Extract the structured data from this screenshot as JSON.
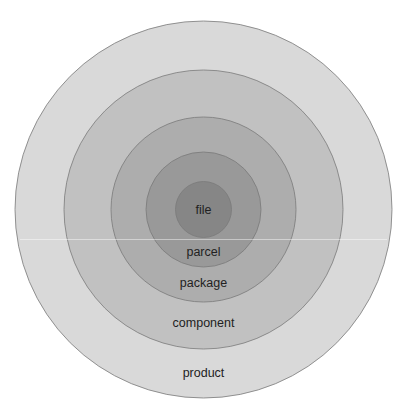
{
  "diagram": {
    "type": "concentric-circles",
    "center": {
      "x": 203.5,
      "y": 209.5
    },
    "rings": [
      {
        "id": "product",
        "label": "product",
        "radius": 188.5,
        "fill": "#d9d9d9",
        "label_y": 374
      },
      {
        "id": "component",
        "label": "component",
        "radius": 139.5,
        "fill": "#c1c1c1",
        "label_y": 324
      },
      {
        "id": "package",
        "label": "package",
        "radius": 92.5,
        "fill": "#adadad",
        "label_y": 284
      },
      {
        "id": "parcel",
        "label": "parcel",
        "radius": 57.5,
        "fill": "#999999",
        "label_y": 253
      },
      {
        "id": "file",
        "label": "file",
        "radius": 28,
        "fill": "#868686",
        "label_y": 211
      }
    ],
    "stroke_color": "#7a7a7a"
  }
}
